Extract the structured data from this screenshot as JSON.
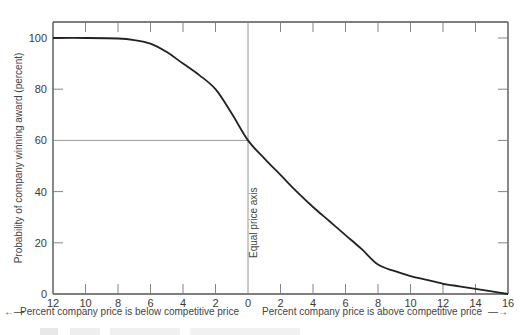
{
  "chart_data": {
    "type": "line",
    "title": "",
    "ylabel": "Probability of company winning award (percent)",
    "xlabel_left": "Percent company price is below competitive price",
    "xlabel_right": "Percent company price is above competitive price",
    "x_tick_labels": [
      "12",
      "10",
      "8",
      "6",
      "4",
      "2",
      "0",
      "2",
      "4",
      "6",
      "8",
      "10",
      "12",
      "14",
      "16"
    ],
    "x": [
      -12,
      -10,
      -8,
      -6,
      -4,
      -2,
      0,
      2,
      4,
      6,
      8,
      10,
      12,
      14,
      16
    ],
    "y_ticks": [
      0,
      20,
      40,
      60,
      80,
      100
    ],
    "y_tick_labels": [
      "0",
      "20",
      "40",
      "60",
      "80",
      "100"
    ],
    "xlim": [
      -12,
      16
    ],
    "ylim": [
      0,
      105
    ],
    "series": [
      {
        "name": "Probability of winning award",
        "x": [
          -12,
          -10,
          -8,
          -7,
          -6,
          -5,
          -4,
          -3,
          -2,
          -1,
          0,
          1,
          2,
          3,
          4,
          5,
          6,
          7,
          8,
          9,
          10,
          11,
          12,
          13,
          14,
          15,
          16
        ],
        "values": [
          100,
          100,
          99.8,
          99.2,
          97.8,
          94.5,
          90,
          85.5,
          80,
          70.5,
          60,
          53,
          46.5,
          40,
          34,
          28.5,
          23,
          17.5,
          11.5,
          9,
          7,
          5.5,
          4,
          3,
          2,
          1,
          0
        ]
      }
    ],
    "reference_lines": [
      {
        "type": "vertical",
        "x": 0,
        "label": "Equal price axis"
      },
      {
        "type": "horizontal",
        "y": 60,
        "from_x": -12,
        "to_x": 0
      }
    ],
    "grid": false,
    "legend": null
  },
  "labels": {
    "equal_price_axis": "Equal price axis",
    "left_arrow": "←—",
    "right_arrow": "—→"
  }
}
